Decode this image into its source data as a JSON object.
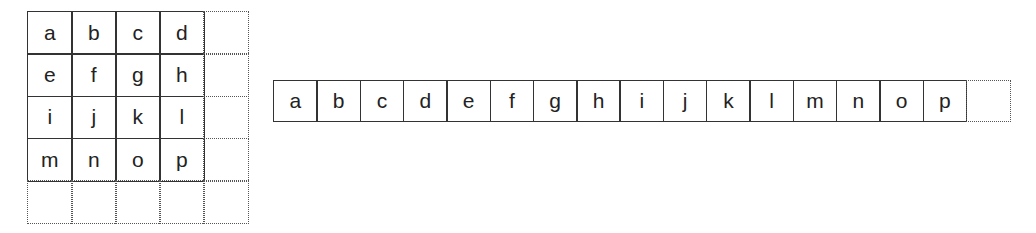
{
  "matrix_grid": {
    "rows": 4,
    "cols": 4,
    "cells": [
      "a",
      "b",
      "c",
      "d",
      "e",
      "f",
      "g",
      "h",
      "i",
      "j",
      "k",
      "l",
      "m",
      "n",
      "o",
      "p"
    ],
    "extra_dotted_column": true,
    "extra_dotted_row": true
  },
  "linear_strip": {
    "cells": [
      "a",
      "b",
      "c",
      "d",
      "e",
      "f",
      "g",
      "h",
      "i",
      "j",
      "k",
      "l",
      "m",
      "n",
      "o",
      "p"
    ],
    "extra_dotted_cell": true
  }
}
